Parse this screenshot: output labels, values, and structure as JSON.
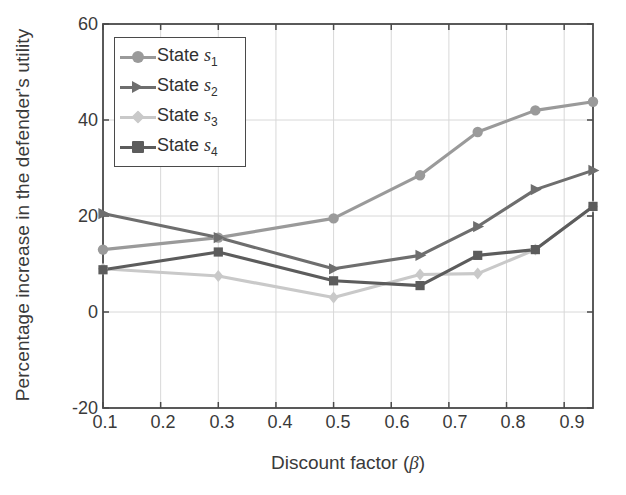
{
  "chart_data": {
    "type": "line",
    "title": "",
    "xlabel": "Discount factor (β)",
    "ylabel": "Percentage increase in the defender's utility",
    "xlim": [
      0.1,
      0.95
    ],
    "ylim": [
      -20,
      60
    ],
    "xticks": [
      "0.1",
      "0.2",
      "0.3",
      "0.4",
      "0.5",
      "0.6",
      "0.7",
      "0.8",
      "0.9"
    ],
    "xtick_values": [
      0.1,
      0.2,
      0.3,
      0.4,
      0.5,
      0.6,
      0.7,
      0.8,
      0.9
    ],
    "yticks": [
      "-20",
      "0",
      "20",
      "40",
      "60"
    ],
    "ytick_values": [
      -20,
      0,
      20,
      40,
      60
    ],
    "grid": true,
    "legend_position": "upper left",
    "x": [
      0.1,
      0.3,
      0.5,
      0.65,
      0.75,
      0.85,
      0.95
    ],
    "series": [
      {
        "name": "State s1",
        "label_base": "State",
        "label_var": "s",
        "label_sub": "1",
        "marker": "circle",
        "color": "#9a9a9a",
        "values": [
          13.0,
          15.5,
          19.5,
          28.5,
          37.5,
          42.0,
          43.8
        ]
      },
      {
        "name": "State s2",
        "label_base": "State",
        "label_var": "s",
        "label_sub": "2",
        "marker": "triangle-right",
        "color": "#6e6e6e",
        "values": [
          20.5,
          15.5,
          9.0,
          11.8,
          17.8,
          25.5,
          29.5
        ]
      },
      {
        "name": "State s3",
        "label_base": "State",
        "label_var": "s",
        "label_sub": "3",
        "marker": "diamond",
        "color": "#c9c9c9",
        "values": [
          9.0,
          7.5,
          3.0,
          7.8,
          8.0,
          13.0,
          22.0
        ]
      },
      {
        "name": "State s4",
        "label_base": "State",
        "label_var": "s",
        "label_sub": "4",
        "marker": "square",
        "color": "#5c5c5c",
        "values": [
          8.8,
          12.5,
          6.5,
          5.5,
          11.8,
          13.0,
          22.0
        ]
      }
    ]
  },
  "axes": {
    "frame_color": "#4a4a4a",
    "grid_color": "#d8d8d8",
    "background": "#ffffff"
  }
}
